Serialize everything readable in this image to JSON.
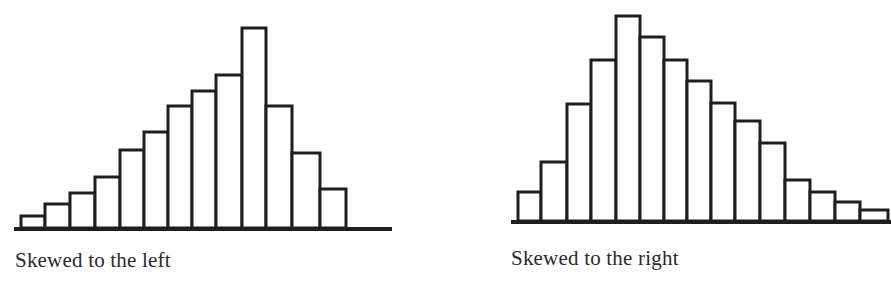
{
  "chart_data": [
    {
      "type": "bar",
      "title": "Skewed to the left",
      "xlabel": "",
      "ylabel": "",
      "grid": false,
      "legend": null,
      "categories": [
        "1",
        "2",
        "3",
        "4",
        "5",
        "6",
        "7",
        "8",
        "9",
        "10",
        "11",
        "12",
        "13"
      ],
      "values": [
        12,
        24,
        35,
        51,
        78,
        96,
        122,
        137,
        153,
        200,
        122,
        75,
        39
      ],
      "ylim": [
        0,
        210
      ],
      "layout": {
        "baseline_y": 228,
        "axis_x0": 14,
        "axis_x1": 392,
        "bar_edges_x": [
          21,
          45,
          70,
          95,
          120,
          144,
          168,
          192,
          216,
          242,
          266,
          292,
          320,
          346
        ]
      }
    },
    {
      "type": "bar",
      "title": "Skewed to the right",
      "xlabel": "",
      "ylabel": "",
      "grid": false,
      "legend": null,
      "categories": [
        "1",
        "2",
        "3",
        "4",
        "5",
        "6",
        "7",
        "8",
        "9",
        "10",
        "11",
        "12",
        "13",
        "14",
        "15"
      ],
      "values": [
        29,
        59,
        117,
        161,
        205,
        184,
        161,
        140,
        118,
        100,
        78,
        41,
        29,
        19,
        11
      ],
      "ylim": [
        0,
        215
      ],
      "layout": {
        "baseline_y": 221,
        "axis_x0": 511,
        "axis_x1": 891,
        "bar_edges_x": [
          518,
          541,
          567,
          591,
          616,
          640,
          664,
          687,
          711,
          735,
          760,
          785,
          810,
          835,
          860,
          888
        ]
      }
    }
  ],
  "captions": {
    "left": "Skewed to the left",
    "right": "Skewed to the right"
  },
  "style": {
    "stroke": "#1e1e1e",
    "fill": "#ffffff"
  }
}
